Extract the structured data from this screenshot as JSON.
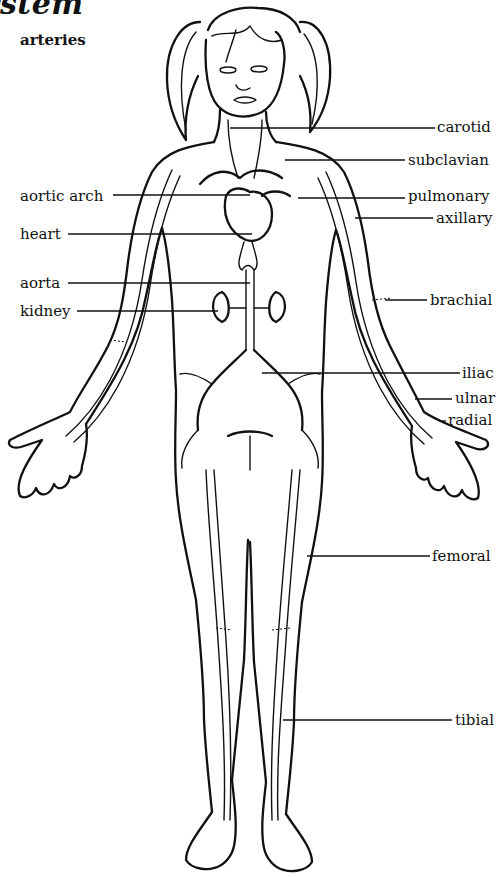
{
  "diagram": {
    "title": "ystem",
    "subtitle": "arteries",
    "left_labels": [
      {
        "id": "aortic-arch",
        "text": "aortic arch",
        "x": 20,
        "y": 187
      },
      {
        "id": "heart",
        "text": "heart",
        "x": 20,
        "y": 225
      },
      {
        "id": "aorta",
        "text": "aorta",
        "x": 20,
        "y": 274
      },
      {
        "id": "kidney",
        "text": "kidney",
        "x": 20,
        "y": 302
      }
    ],
    "right_labels": [
      {
        "id": "carotid",
        "text": "carotid",
        "x": 437,
        "y": 118
      },
      {
        "id": "subclavian",
        "text": "subclavian",
        "x": 408,
        "y": 151
      },
      {
        "id": "pulmonary",
        "text": "pulmonary",
        "x": 408,
        "y": 187
      },
      {
        "id": "axillary",
        "text": "axillary",
        "x": 436,
        "y": 211
      },
      {
        "id": "brachial",
        "text": "brachial",
        "x": 430,
        "y": 291
      },
      {
        "id": "iliac",
        "text": "iliac",
        "x": 462,
        "y": 366
      },
      {
        "id": "ulnar",
        "text": "ulnar",
        "x": 455,
        "y": 390
      },
      {
        "id": "radial",
        "text": "radial",
        "x": 448,
        "y": 412
      },
      {
        "id": "femoral",
        "text": "femoral",
        "x": 432,
        "y": 548
      },
      {
        "id": "tibial",
        "text": "tibial",
        "x": 455,
        "y": 712
      }
    ]
  }
}
